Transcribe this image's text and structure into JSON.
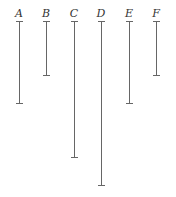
{
  "diagram": {
    "segments": [
      {
        "label": "A",
        "x": 19,
        "top": 21,
        "bottom": 103
      },
      {
        "label": "B",
        "x": 46,
        "top": 21,
        "bottom": 75
      },
      {
        "label": "C",
        "x": 74,
        "top": 21,
        "bottom": 157
      },
      {
        "label": "D",
        "x": 101,
        "top": 21,
        "bottom": 185
      },
      {
        "label": "E",
        "x": 129,
        "top": 21,
        "bottom": 103
      },
      {
        "label": "F",
        "x": 156,
        "top": 21,
        "bottom": 75
      }
    ],
    "line_color": "#666666"
  }
}
